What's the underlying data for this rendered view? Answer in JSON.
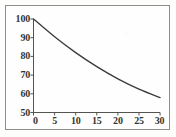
{
  "chart_data": {
    "type": "line",
    "title": "",
    "subtitle": "",
    "xlabel": "",
    "ylabel": "",
    "x": [
      0,
      5,
      10,
      15,
      20,
      25,
      30
    ],
    "values": [
      100,
      90.5,
      82,
      74.5,
      68,
      62.5,
      58
    ],
    "series": [
      {
        "name": "decay-curve",
        "values": [
          100,
          90.5,
          82,
          74.5,
          68,
          62.5,
          58
        ]
      }
    ],
    "xlim": [
      0,
      30
    ],
    "ylim": [
      50,
      100
    ],
    "xticks": [
      0,
      5,
      10,
      15,
      20,
      25,
      30
    ],
    "yticks": [
      50,
      60,
      70,
      80,
      90,
      100
    ],
    "xtick_labels": [
      "0",
      "5",
      "10",
      "15",
      "20",
      "25",
      "30"
    ],
    "ytick_labels": [
      "50",
      "60",
      "70",
      "80",
      "90",
      "100"
    ],
    "grid": false,
    "legend": false,
    "legend_position": "none",
    "annotations": []
  },
  "style": {
    "line_color": "#3c3c38",
    "axis_color": "#55554f",
    "frame_color": "#8d8d8d",
    "background_color": "#fefefe",
    "tick_label_color": "#35352f"
  }
}
